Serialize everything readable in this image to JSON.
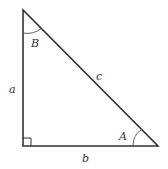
{
  "diagram": {
    "type": "right-triangle",
    "stroke_color": "#333333",
    "background": "#ffffff",
    "vertices": {
      "top": [
        23,
        10
      ],
      "right_angle": [
        23,
        146
      ],
      "right": [
        158,
        146
      ]
    },
    "sides": {
      "a": "a",
      "b": "b",
      "c": "c"
    },
    "angles": {
      "A": "A",
      "B": "B"
    },
    "right_angle_marker": true
  }
}
